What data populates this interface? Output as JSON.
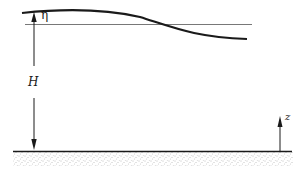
{
  "diagram": {
    "type": "shallow-water wave schematic",
    "labels": {
      "eta": "η",
      "depth": "H",
      "vertical_axis": "z"
    },
    "elements": [
      {
        "name": "free-surface",
        "description": "wavy free surface curve"
      },
      {
        "name": "mean-water-level",
        "description": "horizontal undisturbed level line"
      },
      {
        "name": "depth-arrow",
        "description": "double-headed vertical arrow spanning depth H"
      },
      {
        "name": "z-axis-arrow",
        "description": "upward arrow indicating z direction"
      },
      {
        "name": "sea-bed",
        "description": "flat bottom with stippled sediment"
      }
    ],
    "colors": {
      "line": "#1a1a1a",
      "thin_line": "#555555",
      "stipple": "#777777"
    }
  }
}
